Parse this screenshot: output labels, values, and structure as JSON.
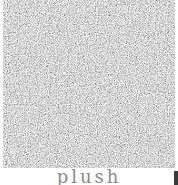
{
  "swatch": {
    "name": "plush",
    "texture": "grey carpet noise",
    "colors": {
      "base": "#b9b9b9",
      "light": "#e6e6e6",
      "dark": "#6e6e6e"
    }
  },
  "label": {
    "text": "plush",
    "color": "#8a8a8a"
  }
}
